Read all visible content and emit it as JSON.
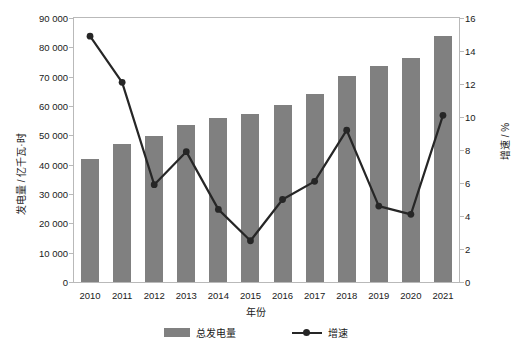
{
  "chart_data": {
    "type": "bar",
    "title": "",
    "xlabel": "年份",
    "ylabel": "发电量 / 亿千瓦·时",
    "y2label": "增速 / %",
    "categories": [
      "2010",
      "2011",
      "2012",
      "2013",
      "2014",
      "2015",
      "2016",
      "2017",
      "2018",
      "2019",
      "2020",
      "2021"
    ],
    "ylim": [
      0,
      90000
    ],
    "y2lim": [
      0,
      16
    ],
    "grid": false,
    "legend_position": "bottom",
    "yticks": [
      "0",
      "10 000",
      "20 000",
      "30 000",
      "40 000",
      "50 000",
      "60 000",
      "70 000",
      "80 000",
      "90 000"
    ],
    "ytick_values": [
      0,
      10000,
      20000,
      30000,
      40000,
      50000,
      60000,
      70000,
      80000,
      90000
    ],
    "y2ticks": [
      "0",
      "2",
      "4",
      "6",
      "8",
      "10",
      "12",
      "14",
      "16"
    ],
    "y2tick_values": [
      0,
      2,
      4,
      6,
      8,
      10,
      12,
      14,
      16
    ],
    "series": [
      {
        "name": "总发电量",
        "type": "bar",
        "axis": "left",
        "color": "#808080",
        "values": [
          42000,
          47000,
          49800,
          53500,
          56000,
          57400,
          60500,
          64200,
          70300,
          73500,
          76300,
          84000
        ]
      },
      {
        "name": "增速",
        "type": "line",
        "axis": "right",
        "color": "#262626",
        "values": [
          14.9,
          12.1,
          5.9,
          7.9,
          4.4,
          2.5,
          5.0,
          6.1,
          9.2,
          4.6,
          4.1,
          10.1
        ]
      }
    ],
    "legend": [
      "总发电量",
      "增速"
    ]
  }
}
